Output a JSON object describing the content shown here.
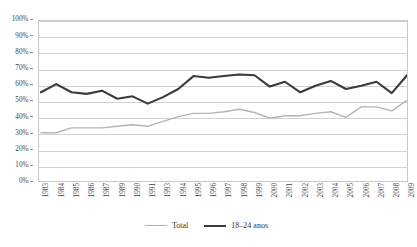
{
  "chart_data": {
    "type": "line",
    "title": "",
    "xlabel": "",
    "ylabel": "",
    "ylim": [
      0,
      100
    ],
    "y_tick_labels": [
      "100%",
      "90%",
      "80%",
      "70%",
      "60%",
      "50%",
      "40%",
      "30%",
      "20%",
      "10%",
      "0%"
    ],
    "y_ticks": [
      100,
      90,
      80,
      70,
      60,
      50,
      40,
      30,
      20,
      10,
      0
    ],
    "grid": true,
    "legend_position": "bottom-center",
    "categories": [
      "1983",
      "1984",
      "1985",
      "1986",
      "1987",
      "1989",
      "1990",
      "1991",
      "1993",
      "1994",
      "1995",
      "1996",
      "1997",
      "1998",
      "1999",
      "2000",
      "2001",
      "2002",
      "2003",
      "2004",
      "2005",
      "2006",
      "2007",
      "2008",
      "2009"
    ],
    "series": [
      {
        "name": "Total",
        "color": "#b4b4b4",
        "values": [
          31,
          31,
          34,
          34,
          34,
          35,
          36,
          35,
          38,
          41,
          43,
          43,
          44,
          45.5,
          43.5,
          40,
          41.5,
          41.5,
          43,
          44,
          40.5,
          47,
          47,
          44.5,
          51
        ]
      },
      {
        "name": "18–24 anos",
        "color": "#3a3a3a",
        "values": [
          56,
          61,
          56,
          55,
          57,
          52,
          53.5,
          49,
          53,
          58,
          66,
          65,
          66,
          67,
          66.5,
          59.5,
          62.5,
          56,
          60,
          63,
          58,
          60,
          62.5,
          55.5,
          66.5
        ]
      }
    ]
  },
  "legend": {
    "items": [
      {
        "label": "Total"
      },
      {
        "label": "18–24 anos"
      }
    ]
  },
  "colors": {
    "total_series": "#b4b4b4",
    "youth_series": "#3a3a3a",
    "gridline": "#d2d2d2",
    "plot_border": "#c9c9c9",
    "text": "#3d3d3d",
    "background": "#ffffff"
  }
}
